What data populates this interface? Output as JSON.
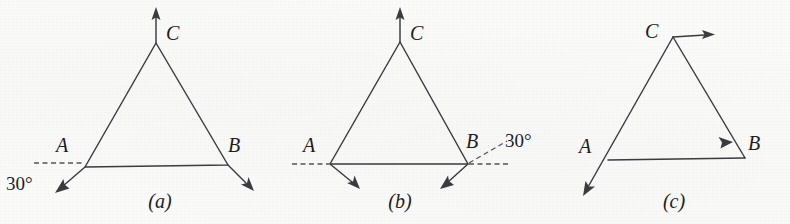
{
  "figure": {
    "background_color": "#fbfbfa",
    "ink_color": "#3c3c42",
    "panel_count": 3
  },
  "panels": [
    {
      "caption": "(a)",
      "vertices": [
        {
          "label": "A",
          "x": 85,
          "y": 167
        },
        {
          "label": "B",
          "x": 228,
          "y": 165
        },
        {
          "label": "C",
          "x": 156,
          "y": 43
        }
      ],
      "angle_annotation": {
        "text": "30°",
        "at_vertex": "A",
        "reference": "dashed-horizontal-left"
      },
      "vectors": [
        {
          "from": "C",
          "direction": "up"
        },
        {
          "from": "A",
          "direction": "down-left"
        },
        {
          "from": "B",
          "direction": "down-right"
        }
      ]
    },
    {
      "caption": "(b)",
      "vertices": [
        {
          "label": "A",
          "x": 330,
          "y": 164
        },
        {
          "label": "B",
          "x": 468,
          "y": 164
        },
        {
          "label": "C",
          "x": 400,
          "y": 42
        }
      ],
      "angle_annotation": {
        "text": "30°",
        "at_vertex": "B",
        "reference": "dashed-horizontal-right"
      },
      "vectors": [
        {
          "from": "C",
          "direction": "up"
        },
        {
          "from": "A",
          "direction": "down-right"
        },
        {
          "from": "B",
          "direction": "down-left"
        }
      ]
    },
    {
      "caption": "(c)",
      "vertices": [
        {
          "label": "A",
          "x": 608,
          "y": 160
        },
        {
          "label": "B",
          "x": 745,
          "y": 158
        },
        {
          "label": "C",
          "x": 673,
          "y": 37
        }
      ],
      "angle_annotation": null,
      "vectors": [
        {
          "from": "C",
          "direction": "right"
        },
        {
          "from": "C",
          "direction": "toward-B"
        },
        {
          "from": "A",
          "direction": "down-left-extended"
        }
      ]
    }
  ],
  "labels": {
    "a_vertex_A": "A",
    "a_vertex_B": "B",
    "a_vertex_C": "C",
    "a_angle": "30°",
    "a_caption": "(a)",
    "b_vertex_A": "A",
    "b_vertex_B": "B",
    "b_vertex_C": "C",
    "b_angle": "30°",
    "b_caption": "(b)",
    "c_vertex_A": "A",
    "c_vertex_B": "B",
    "c_vertex_C": "C",
    "c_caption": "(c)"
  }
}
